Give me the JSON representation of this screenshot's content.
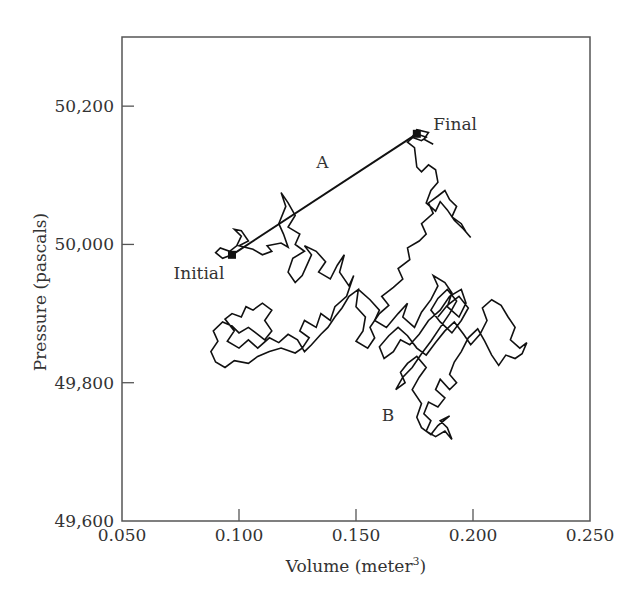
{
  "chart_data": {
    "type": "line",
    "title": "",
    "xlabel": "Volume (meter3)",
    "xlabel_base": "Volume (meter",
    "xlabel_sup": "3",
    "xlabel_close": ")",
    "ylabel": "Pressure (pascals)",
    "xlim": [
      0.05,
      0.25
    ],
    "ylim": [
      49600,
      50300
    ],
    "grid": false,
    "legend": null,
    "x_ticks": [
      0.05,
      0.1,
      0.15,
      0.2,
      0.25
    ],
    "x_tick_labels": [
      "0.050",
      "0.100",
      "0.150",
      "0.200",
      "0.250"
    ],
    "y_ticks": [
      49600,
      49800,
      50000,
      50200
    ],
    "y_tick_labels": [
      "49,600",
      "49,800",
      "50,000",
      "50,200"
    ],
    "annotations": [
      {
        "text": "Initial",
        "x": 0.072,
        "y": 49950
      },
      {
        "text": "A",
        "x": 0.133,
        "y": 50110
      },
      {
        "text": "Final",
        "x": 0.183,
        "y": 50165
      },
      {
        "text": "B",
        "x": 0.161,
        "y": 49745
      }
    ],
    "key_points": {
      "initial": {
        "x": 0.097,
        "y": 49985
      },
      "final": {
        "x": 0.176,
        "y": 50160
      }
    },
    "series": [
      {
        "name": "Path A (direct)",
        "style": "straight-line",
        "points": [
          [
            0.097,
            49985
          ],
          [
            0.176,
            50160
          ]
        ]
      },
      {
        "name": "Path B (random walk)",
        "style": "jagged-random-walk",
        "points": [
          [
            0.097,
            49985
          ],
          [
            0.093,
            49980
          ],
          [
            0.09,
            49988
          ],
          [
            0.092,
            49995
          ],
          [
            0.096,
            49990
          ],
          [
            0.099,
            49998
          ],
          [
            0.101,
            50012
          ],
          [
            0.098,
            50022
          ],
          [
            0.101,
            50020
          ],
          [
            0.104,
            50005
          ],
          [
            0.1,
            49998
          ],
          [
            0.106,
            49993
          ],
          [
            0.11,
            49985
          ],
          [
            0.114,
            49990
          ],
          [
            0.112,
            49998
          ],
          [
            0.118,
            50002
          ],
          [
            0.121,
            49996
          ],
          [
            0.119,
            50015
          ],
          [
            0.117,
            50030
          ],
          [
            0.12,
            50055
          ],
          [
            0.118,
            50075
          ],
          [
            0.121,
            50060
          ],
          [
            0.124,
            50042
          ],
          [
            0.121,
            50025
          ],
          [
            0.126,
            50015
          ],
          [
            0.124,
            50000
          ],
          [
            0.128,
            49990
          ],
          [
            0.123,
            49980
          ],
          [
            0.121,
            49960
          ],
          [
            0.124,
            49945
          ],
          [
            0.127,
            49955
          ],
          [
            0.129,
            49970
          ],
          [
            0.131,
            49985
          ],
          [
            0.128,
            49998
          ],
          [
            0.133,
            49990
          ],
          [
            0.137,
            49975
          ],
          [
            0.134,
            49960
          ],
          [
            0.139,
            49950
          ],
          [
            0.142,
            49970
          ],
          [
            0.145,
            49985
          ],
          [
            0.143,
            49960
          ],
          [
            0.147,
            49940
          ],
          [
            0.149,
            49955
          ],
          [
            0.146,
            49925
          ],
          [
            0.141,
            49910
          ],
          [
            0.139,
            49890
          ],
          [
            0.135,
            49900
          ],
          [
            0.133,
            49880
          ],
          [
            0.128,
            49890
          ],
          [
            0.126,
            49875
          ],
          [
            0.13,
            49865
          ],
          [
            0.127,
            49850
          ],
          [
            0.124,
            49843
          ],
          [
            0.118,
            49850
          ],
          [
            0.113,
            49845
          ],
          [
            0.108,
            49838
          ],
          [
            0.104,
            49828
          ],
          [
            0.098,
            49832
          ],
          [
            0.094,
            49822
          ],
          [
            0.09,
            49830
          ],
          [
            0.088,
            49845
          ],
          [
            0.091,
            49860
          ],
          [
            0.089,
            49875
          ],
          [
            0.093,
            49888
          ],
          [
            0.097,
            49882
          ],
          [
            0.1,
            49872
          ],
          [
            0.104,
            49880
          ],
          [
            0.108,
            49870
          ],
          [
            0.111,
            49862
          ],
          [
            0.114,
            49875
          ],
          [
            0.111,
            49890
          ],
          [
            0.114,
            49905
          ],
          [
            0.11,
            49915
          ],
          [
            0.106,
            49905
          ],
          [
            0.103,
            49910
          ],
          [
            0.101,
            49895
          ],
          [
            0.097,
            49900
          ],
          [
            0.094,
            49892
          ],
          [
            0.098,
            49875
          ],
          [
            0.095,
            49860
          ],
          [
            0.1,
            49850
          ],
          [
            0.104,
            49862
          ],
          [
            0.108,
            49850
          ],
          [
            0.113,
            49865
          ],
          [
            0.117,
            49858
          ],
          [
            0.121,
            49870
          ],
          [
            0.125,
            49862
          ],
          [
            0.128,
            49845
          ],
          [
            0.131,
            49855
          ],
          [
            0.135,
            49870
          ],
          [
            0.138,
            49880
          ],
          [
            0.141,
            49895
          ],
          [
            0.144,
            49908
          ],
          [
            0.147,
            49925
          ],
          [
            0.151,
            49935
          ],
          [
            0.15,
            49910
          ],
          [
            0.154,
            49895
          ],
          [
            0.153,
            49875
          ],
          [
            0.15,
            49860
          ],
          [
            0.155,
            49850
          ],
          [
            0.158,
            49865
          ],
          [
            0.156,
            49880
          ],
          [
            0.16,
            49900
          ],
          [
            0.164,
            49912
          ],
          [
            0.161,
            49925
          ],
          [
            0.166,
            49938
          ],
          [
            0.17,
            49950
          ],
          [
            0.168,
            49965
          ],
          [
            0.173,
            49978
          ],
          [
            0.172,
            49995
          ],
          [
            0.177,
            50005
          ],
          [
            0.18,
            50015
          ],
          [
            0.178,
            50030
          ],
          [
            0.183,
            50045
          ],
          [
            0.181,
            50060
          ],
          [
            0.185,
            50070
          ],
          [
            0.188,
            50078
          ],
          [
            0.19,
            50065
          ],
          [
            0.193,
            50055
          ],
          [
            0.191,
            50040
          ],
          [
            0.195,
            50030
          ],
          [
            0.197,
            50018
          ],
          [
            0.199,
            50010
          ],
          [
            0.196,
            50022
          ],
          [
            0.192,
            50035
          ],
          [
            0.189,
            50050
          ],
          [
            0.186,
            50062
          ],
          [
            0.184,
            50048
          ],
          [
            0.18,
            50060
          ],
          [
            0.182,
            50078
          ],
          [
            0.185,
            50090
          ],
          [
            0.184,
            50108
          ],
          [
            0.181,
            50115
          ],
          [
            0.178,
            50105
          ],
          [
            0.176,
            50112
          ],
          [
            0.175,
            50140
          ],
          [
            0.172,
            50148
          ],
          [
            0.176,
            50160
          ],
          [
            0.18,
            50155
          ],
          [
            0.178,
            50150
          ],
          [
            0.174,
            50155
          ],
          [
            0.176,
            50166
          ],
          [
            0.181,
            50162
          ],
          [
            0.179,
            50152
          ],
          [
            0.183,
            50145
          ]
        ]
      },
      {
        "name": "Cluster B (dense wandering region)",
        "style": "jagged-random-walk",
        "center": {
          "x": 0.187,
          "y": 49870
        },
        "extent": {
          "x_min": 0.155,
          "x_max": 0.225,
          "y_min": 49710,
          "y_max": 49950
        },
        "points": [
          [
            0.151,
            49935
          ],
          [
            0.156,
            49920
          ],
          [
            0.16,
            49905
          ],
          [
            0.158,
            49890
          ],
          [
            0.163,
            49880
          ],
          [
            0.168,
            49900
          ],
          [
            0.172,
            49915
          ],
          [
            0.17,
            49895
          ],
          [
            0.175,
            49880
          ],
          [
            0.178,
            49902
          ],
          [
            0.182,
            49920
          ],
          [
            0.185,
            49940
          ],
          [
            0.183,
            49955
          ],
          [
            0.188,
            49945
          ],
          [
            0.191,
            49930
          ],
          [
            0.189,
            49910
          ],
          [
            0.194,
            49895
          ],
          [
            0.197,
            49915
          ],
          [
            0.195,
            49935
          ],
          [
            0.19,
            49925
          ],
          [
            0.186,
            49905
          ],
          [
            0.181,
            49890
          ],
          [
            0.177,
            49870
          ],
          [
            0.173,
            49855
          ],
          [
            0.169,
            49862
          ],
          [
            0.166,
            49845
          ],
          [
            0.162,
            49835
          ],
          [
            0.16,
            49852
          ],
          [
            0.164,
            49868
          ],
          [
            0.168,
            49880
          ],
          [
            0.172,
            49868
          ],
          [
            0.176,
            49850
          ],
          [
            0.18,
            49840
          ],
          [
            0.184,
            49858
          ],
          [
            0.188,
            49875
          ],
          [
            0.192,
            49888
          ],
          [
            0.196,
            49870
          ],
          [
            0.199,
            49855
          ],
          [
            0.203,
            49870
          ],
          [
            0.206,
            49890
          ],
          [
            0.204,
            49908
          ],
          [
            0.208,
            49920
          ],
          [
            0.212,
            49912
          ],
          [
            0.215,
            49895
          ],
          [
            0.218,
            49880
          ],
          [
            0.216,
            49862
          ],
          [
            0.22,
            49850
          ],
          [
            0.223,
            49858
          ],
          [
            0.221,
            49842
          ],
          [
            0.218,
            49835
          ],
          [
            0.214,
            49840
          ],
          [
            0.211,
            49825
          ],
          [
            0.208,
            49840
          ],
          [
            0.205,
            49860
          ],
          [
            0.202,
            49878
          ],
          [
            0.198,
            49865
          ],
          [
            0.195,
            49845
          ],
          [
            0.192,
            49830
          ],
          [
            0.19,
            49812
          ],
          [
            0.193,
            49800
          ],
          [
            0.19,
            49790
          ],
          [
            0.186,
            49805
          ],
          [
            0.184,
            49790
          ],
          [
            0.188,
            49778
          ],
          [
            0.185,
            49765
          ],
          [
            0.181,
            49772
          ],
          [
            0.179,
            49755
          ],
          [
            0.182,
            49745
          ],
          [
            0.18,
            49730
          ],
          [
            0.184,
            49722
          ],
          [
            0.188,
            49730
          ],
          [
            0.191,
            49718
          ],
          [
            0.189,
            49735
          ],
          [
            0.186,
            49745
          ],
          [
            0.19,
            49752
          ],
          [
            0.185,
            49738
          ],
          [
            0.182,
            49725
          ],
          [
            0.178,
            49735
          ],
          [
            0.176,
            49750
          ],
          [
            0.178,
            49770
          ],
          [
            0.174,
            49790
          ],
          [
            0.177,
            49808
          ],
          [
            0.18,
            49822
          ],
          [
            0.176,
            49838
          ],
          [
            0.172,
            49828
          ],
          [
            0.169,
            49815
          ],
          [
            0.171,
            49800
          ],
          [
            0.167,
            49790
          ],
          [
            0.17,
            49808
          ],
          [
            0.174,
            49822
          ],
          [
            0.178,
            49842
          ],
          [
            0.182,
            49860
          ],
          [
            0.186,
            49880
          ],
          [
            0.19,
            49900
          ],
          [
            0.193,
            49918
          ],
          [
            0.189,
            49935
          ],
          [
            0.185,
            49922
          ],
          [
            0.182,
            49905
          ],
          [
            0.186,
            49888
          ],
          [
            0.191,
            49872
          ],
          [
            0.195,
            49890
          ],
          [
            0.198,
            49908
          ],
          [
            0.194,
            49925
          ],
          [
            0.189,
            49912
          ],
          [
            0.185,
            49895
          ]
        ]
      }
    ]
  }
}
